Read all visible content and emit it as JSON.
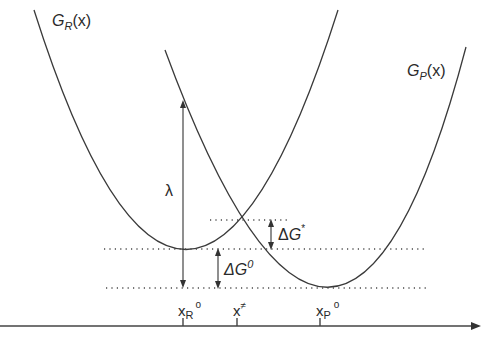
{
  "figure": {
    "type": "marcus-free-energy-parabolas",
    "curves": [
      {
        "id": "reactant",
        "label_main": "G",
        "label_sub": "R",
        "label_tail": "(x)"
      },
      {
        "id": "product",
        "label_main": "G",
        "label_sub": "P",
        "label_tail": "(x)"
      }
    ],
    "annotations": {
      "lambda": "λ",
      "activation": {
        "delta": "Δ",
        "symbol": "G",
        "sup": "*"
      },
      "driving_force": {
        "delta": "Δ",
        "symbol": "G",
        "sup": "0"
      }
    },
    "x_axis": {
      "ticks": [
        {
          "main": "x",
          "sub": "R",
          "sup": "o"
        },
        {
          "main": "x",
          "sub": "",
          "sup": "≠"
        },
        {
          "main": "x",
          "sub": "P",
          "sup": "o"
        }
      ]
    }
  }
}
